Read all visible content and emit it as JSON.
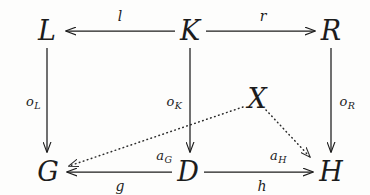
{
  "diagram": {
    "background_color": "#fdfdfc",
    "stroke_color": "#1c1c1c",
    "nodes": [
      {
        "id": "L",
        "label": "L",
        "x": 47,
        "y": 30
      },
      {
        "id": "K",
        "label": "K",
        "x": 190,
        "y": 30
      },
      {
        "id": "R",
        "label": "R",
        "x": 331,
        "y": 30
      },
      {
        "id": "G",
        "label": "G",
        "x": 48,
        "y": 171
      },
      {
        "id": "D",
        "label": "D",
        "x": 188,
        "y": 171
      },
      {
        "id": "H",
        "label": "H",
        "x": 331,
        "y": 171
      },
      {
        "id": "X",
        "label": "X",
        "x": 257,
        "y": 98
      }
    ],
    "edges": [
      {
        "id": "l",
        "from": "K",
        "to": "L",
        "label": "l",
        "sub": "",
        "style": "solid",
        "label_x": 120,
        "label_y": 16,
        "x1": 175,
        "y1": 31,
        "x2": 66,
        "y2": 31
      },
      {
        "id": "r",
        "from": "K",
        "to": "R",
        "label": "r",
        "sub": "",
        "style": "solid",
        "label_x": 263,
        "label_y": 16,
        "x1": 206,
        "y1": 31,
        "x2": 315,
        "y2": 31
      },
      {
        "id": "oL",
        "from": "L",
        "to": "G",
        "label": "o",
        "sub": "L",
        "style": "solid",
        "label_x": 33,
        "label_y": 101,
        "x1": 47,
        "y1": 48,
        "x2": 47,
        "y2": 152
      },
      {
        "id": "oK",
        "from": "K",
        "to": "D",
        "label": "o",
        "sub": "K",
        "style": "solid",
        "label_x": 174,
        "label_y": 101,
        "x1": 190,
        "y1": 48,
        "x2": 190,
        "y2": 152
      },
      {
        "id": "oR",
        "from": "R",
        "to": "H",
        "label": "o",
        "sub": "R",
        "style": "solid",
        "label_x": 347,
        "label_y": 101,
        "x1": 331,
        "y1": 48,
        "x2": 331,
        "y2": 152
      },
      {
        "id": "g",
        "from": "D",
        "to": "G",
        "label": "g",
        "sub": "",
        "style": "solid",
        "label_x": 120,
        "label_y": 186,
        "x1": 172,
        "y1": 172,
        "x2": 67,
        "y2": 172
      },
      {
        "id": "h",
        "from": "D",
        "to": "H",
        "label": "h",
        "sub": "",
        "style": "solid",
        "label_x": 262,
        "label_y": 186,
        "x1": 204,
        "y1": 172,
        "x2": 313,
        "y2": 172
      },
      {
        "id": "aG",
        "from": "X",
        "to": "G",
        "label": "a",
        "sub": "G",
        "style": "dotted",
        "label_x": 164,
        "label_y": 155,
        "x1": 243,
        "y1": 107,
        "x2": 69,
        "y2": 166
      },
      {
        "id": "aH",
        "from": "X",
        "to": "H",
        "label": "a",
        "sub": "H",
        "style": "dotted",
        "label_x": 278,
        "label_y": 155,
        "x1": 266,
        "y1": 110,
        "x2": 310,
        "y2": 157
      }
    ]
  }
}
